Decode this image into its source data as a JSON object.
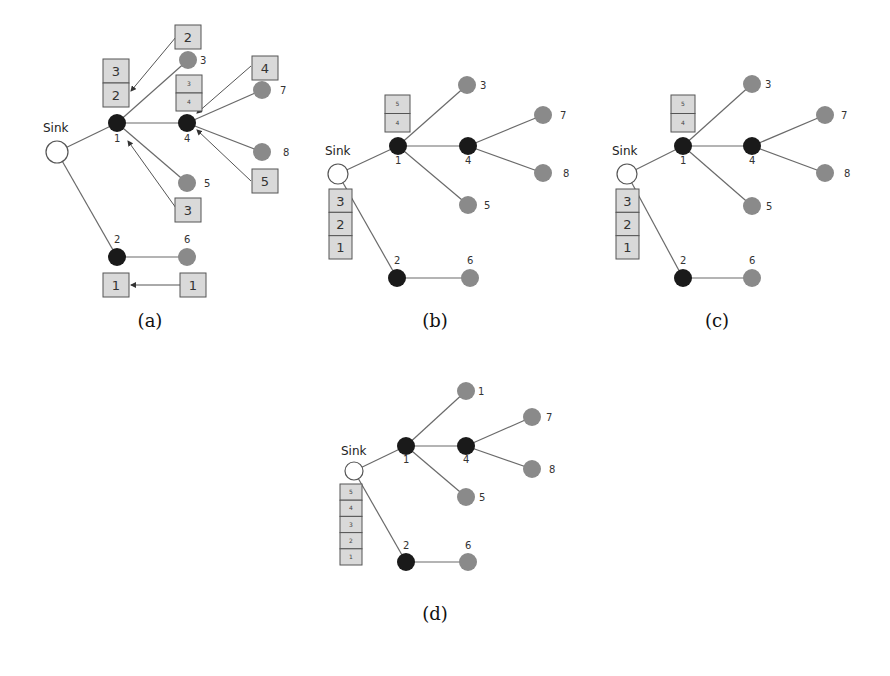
{
  "figure": {
    "colors": {
      "sink_fill": "#ffffff",
      "sink_stroke": "#555555",
      "head_node": "#1a1a1a",
      "leaf_node": "#8a8a8a",
      "edge": "#6a6a6a",
      "box_fill": "#d9d9d9",
      "box_stroke": "#555555",
      "background": "#ffffff"
    },
    "panels": [
      {
        "id": "a",
        "caption": "(a)",
        "caption_pos": [
          150,
          327
        ],
        "sink": {
          "label": "Sink",
          "x": 57,
          "y": 152,
          "r": 11,
          "label_pos": [
            43,
            132
          ]
        },
        "nodes": [
          {
            "id": "1",
            "label": "1",
            "type": "head",
            "x": 117,
            "y": 123,
            "label_pos": [
              114,
              142
            ]
          },
          {
            "id": "4",
            "label": "4",
            "type": "head",
            "x": 187,
            "y": 123,
            "label_pos": [
              184,
              142
            ]
          },
          {
            "id": "3",
            "label": "3",
            "type": "leaf",
            "x": 188,
            "y": 60,
            "label_pos": [
              200,
              64
            ]
          },
          {
            "id": "7",
            "label": "7",
            "type": "leaf",
            "x": 262,
            "y": 90,
            "label_pos": [
              280,
              94
            ]
          },
          {
            "id": "8",
            "label": "8",
            "type": "leaf",
            "x": 262,
            "y": 152,
            "label_pos": [
              283,
              156
            ]
          },
          {
            "id": "5",
            "label": "5",
            "type": "leaf",
            "x": 187,
            "y": 183,
            "label_pos": [
              204,
              187
            ]
          },
          {
            "id": "2",
            "label": "2",
            "type": "head",
            "x": 117,
            "y": 257,
            "label_pos": [
              114,
              243
            ]
          },
          {
            "id": "6",
            "label": "6",
            "type": "leaf",
            "x": 187,
            "y": 257,
            "label_pos": [
              184,
              243
            ]
          }
        ],
        "edges": [
          [
            "sink",
            "1"
          ],
          [
            "sink",
            "2"
          ],
          [
            "1",
            "4"
          ],
          [
            "1",
            "3"
          ],
          [
            "1",
            "5"
          ],
          [
            "4",
            "7"
          ],
          [
            "4",
            "8"
          ],
          [
            "2",
            "6"
          ]
        ],
        "boxes": [
          {
            "x": 175,
            "y": 25,
            "w": 26,
            "h": 24,
            "values": [
              "2"
            ],
            "size": "big"
          },
          {
            "x": 103,
            "y": 59,
            "w": 26,
            "h": 48,
            "values": [
              "3",
              "2"
            ],
            "size": "big"
          },
          {
            "x": 176,
            "y": 75,
            "w": 26,
            "h": 36,
            "values": [
              "3",
              "4"
            ],
            "size": "small"
          },
          {
            "x": 252,
            "y": 56,
            "w": 26,
            "h": 24,
            "values": [
              "4"
            ],
            "size": "big"
          },
          {
            "x": 252,
            "y": 169,
            "w": 26,
            "h": 24,
            "values": [
              "5"
            ],
            "size": "big"
          },
          {
            "x": 175,
            "y": 198,
            "w": 26,
            "h": 24,
            "values": [
              "3"
            ],
            "size": "big"
          },
          {
            "x": 103,
            "y": 273,
            "w": 26,
            "h": 24,
            "values": [
              "1"
            ],
            "size": "big"
          },
          {
            "x": 180,
            "y": 273,
            "w": 26,
            "h": 24,
            "values": [
              "1"
            ],
            "size": "big"
          }
        ],
        "arrows": [
          {
            "from": [
              176,
              37
            ],
            "to": [
              131,
              91
            ]
          },
          {
            "from": [
              251,
              66
            ],
            "to": [
              197,
              113
            ]
          },
          {
            "from": [
              251,
              181
            ],
            "to": [
              197,
              130
            ]
          },
          {
            "from": [
              176,
              208
            ],
            "to": [
              128,
              141
            ]
          },
          {
            "from": [
              180,
              285
            ],
            "to": [
              131,
              285
            ]
          }
        ]
      },
      {
        "id": "b",
        "caption": "(b)",
        "caption_pos": [
          435,
          327
        ],
        "sink": {
          "label": "Sink",
          "x": 338,
          "y": 174,
          "r": 10,
          "label_pos": [
            325,
            155
          ]
        },
        "nodes": [
          {
            "id": "1",
            "label": "1",
            "type": "head",
            "x": 398,
            "y": 146,
            "label_pos": [
              395,
              164
            ]
          },
          {
            "id": "4",
            "label": "4",
            "type": "head",
            "x": 468,
            "y": 146,
            "label_pos": [
              465,
              164
            ]
          },
          {
            "id": "3",
            "label": "3",
            "type": "leaf",
            "x": 467,
            "y": 85,
            "label_pos": [
              480,
              89
            ]
          },
          {
            "id": "7",
            "label": "7",
            "type": "leaf",
            "x": 543,
            "y": 115,
            "label_pos": [
              560,
              119
            ]
          },
          {
            "id": "8",
            "label": "8",
            "type": "leaf",
            "x": 543,
            "y": 173,
            "label_pos": [
              563,
              177
            ]
          },
          {
            "id": "5",
            "label": "5",
            "type": "leaf",
            "x": 468,
            "y": 205,
            "label_pos": [
              484,
              209
            ]
          },
          {
            "id": "2",
            "label": "2",
            "type": "head",
            "x": 397,
            "y": 278,
            "label_pos": [
              394,
              264
            ]
          },
          {
            "id": "6",
            "label": "6",
            "type": "leaf",
            "x": 470,
            "y": 278,
            "label_pos": [
              467,
              264
            ]
          }
        ],
        "edges": [
          [
            "sink",
            "1"
          ],
          [
            "sink",
            "2"
          ],
          [
            "1",
            "4"
          ],
          [
            "1",
            "3"
          ],
          [
            "1",
            "5"
          ],
          [
            "4",
            "7"
          ],
          [
            "4",
            "8"
          ],
          [
            "2",
            "6"
          ]
        ],
        "boxes": [
          {
            "x": 385,
            "y": 95,
            "w": 25,
            "h": 37,
            "values": [
              "5",
              "4"
            ],
            "size": "small"
          },
          {
            "x": 329,
            "y": 189,
            "w": 23,
            "h": 70,
            "values": [
              "3",
              "2",
              "1"
            ],
            "size": "big"
          }
        ],
        "arrows": []
      },
      {
        "id": "c",
        "caption": "(c)",
        "caption_pos": [
          717,
          327
        ],
        "sink": {
          "label": "Sink",
          "x": 627,
          "y": 174,
          "r": 10,
          "label_pos": [
            612,
            155
          ]
        },
        "nodes": [
          {
            "id": "1",
            "label": "1",
            "type": "head",
            "x": 683,
            "y": 146,
            "label_pos": [
              680,
              164
            ]
          },
          {
            "id": "4",
            "label": "4",
            "type": "head",
            "x": 752,
            "y": 146,
            "label_pos": [
              749,
              164
            ]
          },
          {
            "id": "3",
            "label": "3",
            "type": "leaf",
            "x": 752,
            "y": 84,
            "label_pos": [
              765,
              88
            ]
          },
          {
            "id": "7",
            "label": "7",
            "type": "leaf",
            "x": 825,
            "y": 115,
            "label_pos": [
              841,
              119
            ]
          },
          {
            "id": "8",
            "label": "8",
            "type": "leaf",
            "x": 825,
            "y": 173,
            "label_pos": [
              844,
              177
            ]
          },
          {
            "id": "5",
            "label": "5",
            "type": "leaf",
            "x": 752,
            "y": 206,
            "label_pos": [
              766,
              210
            ]
          },
          {
            "id": "2",
            "label": "2",
            "type": "head",
            "x": 683,
            "y": 278,
            "label_pos": [
              680,
              264
            ]
          },
          {
            "id": "6",
            "label": "6",
            "type": "leaf",
            "x": 752,
            "y": 278,
            "label_pos": [
              749,
              264
            ]
          }
        ],
        "edges": [
          [
            "sink",
            "1"
          ],
          [
            "sink",
            "2"
          ],
          [
            "1",
            "4"
          ],
          [
            "1",
            "3"
          ],
          [
            "1",
            "5"
          ],
          [
            "4",
            "7"
          ],
          [
            "4",
            "8"
          ],
          [
            "2",
            "6"
          ]
        ],
        "boxes": [
          {
            "x": 671,
            "y": 95,
            "w": 24,
            "h": 37,
            "values": [
              "5",
              "4"
            ],
            "size": "small"
          },
          {
            "x": 616,
            "y": 189,
            "w": 23,
            "h": 70,
            "values": [
              "3",
              "2",
              "1"
            ],
            "size": "big"
          }
        ],
        "arrows": []
      },
      {
        "id": "d",
        "caption": "(d)",
        "caption_pos": [
          435,
          620
        ],
        "sink": {
          "label": "Sink",
          "x": 354,
          "y": 471,
          "r": 9,
          "label_pos": [
            341,
            455
          ]
        },
        "nodes": [
          {
            "id": "1",
            "label": "1",
            "type": "head",
            "x": 406,
            "y": 446,
            "label_pos": [
              403,
              463
            ]
          },
          {
            "id": "4",
            "label": "4",
            "type": "head",
            "x": 466,
            "y": 446,
            "label_pos": [
              463,
              463
            ]
          },
          {
            "id": "3",
            "label": "1",
            "type": "leaf",
            "x": 466,
            "y": 391,
            "label_pos": [
              478,
              395
            ]
          },
          {
            "id": "7",
            "label": "7",
            "type": "leaf",
            "x": 532,
            "y": 417,
            "label_pos": [
              546,
              421
            ]
          },
          {
            "id": "8",
            "label": "8",
            "type": "leaf",
            "x": 532,
            "y": 469,
            "label_pos": [
              549,
              473
            ]
          },
          {
            "id": "5",
            "label": "5",
            "type": "leaf",
            "x": 466,
            "y": 497,
            "label_pos": [
              479,
              501
            ]
          },
          {
            "id": "2",
            "label": "2",
            "type": "head",
            "x": 406,
            "y": 562,
            "label_pos": [
              403,
              549
            ]
          },
          {
            "id": "6",
            "label": "6",
            "type": "leaf",
            "x": 468,
            "y": 562,
            "label_pos": [
              465,
              549
            ]
          }
        ],
        "edges": [
          [
            "sink",
            "1"
          ],
          [
            "sink",
            "2"
          ],
          [
            "1",
            "4"
          ],
          [
            "1",
            "3"
          ],
          [
            "1",
            "5"
          ],
          [
            "4",
            "7"
          ],
          [
            "4",
            "8"
          ],
          [
            "2",
            "6"
          ]
        ],
        "boxes": [
          {
            "x": 340,
            "y": 484,
            "w": 22,
            "h": 81,
            "values": [
              "5",
              "4",
              "3",
              "2",
              "1"
            ],
            "size": "small"
          }
        ],
        "arrows": []
      }
    ]
  }
}
